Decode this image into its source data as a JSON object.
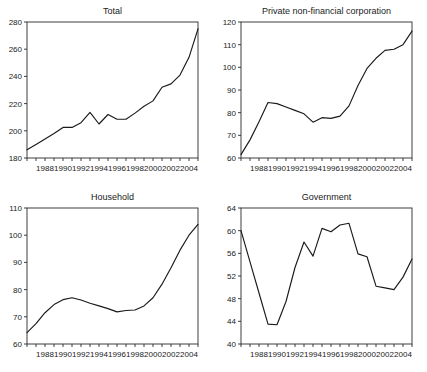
{
  "figure": {
    "width": 427,
    "height": 372,
    "background": "#ffffff",
    "line_color": "#1a1a1a",
    "axis_color": "#2a2a2a"
  },
  "panels": [
    {
      "id": "total",
      "title": "Total"
    },
    {
      "id": "corporation",
      "title": "Private non-financial corporation"
    },
    {
      "id": "household",
      "title": "Household"
    },
    {
      "id": "government",
      "title": "Government"
    }
  ],
  "chart_data": [
    {
      "type": "line",
      "title": "Total",
      "xlabel": "",
      "ylabel": "",
      "xlim": [
        1986,
        2005
      ],
      "ylim": [
        180,
        280
      ],
      "yticks": [
        180,
        200,
        220,
        240,
        260,
        280
      ],
      "ytick_labels": [
        "180",
        "200",
        "220",
        "240",
        "260",
        "280"
      ],
      "xticks": [
        1986,
        1987,
        1988,
        1989,
        1990,
        1991,
        1992,
        1993,
        1994,
        1995,
        1996,
        1997,
        1998,
        1999,
        2000,
        2001,
        2002,
        2003,
        2004,
        2005
      ],
      "xtick_labels": [
        "1988",
        "1990",
        "1992",
        "1994",
        "1996",
        "1998",
        "2000",
        "2002",
        "2004"
      ],
      "xtick_label_years": [
        1988,
        1990,
        1992,
        1994,
        1996,
        1998,
        2000,
        2002,
        2004
      ],
      "grid": false,
      "legend": false,
      "x": [
        1986,
        1987,
        1988,
        1989,
        1990,
        1991,
        1992,
        1993,
        1994,
        1995,
        1996,
        1997,
        1998,
        1999,
        2000,
        2001,
        2002,
        2003,
        2004,
        2005
      ],
      "values": [
        186,
        190,
        194,
        198,
        202.5,
        202.5,
        206,
        213.5,
        205,
        212,
        208.5,
        208.5,
        213,
        218,
        222,
        232,
        234.5,
        241,
        254,
        275
      ]
    },
    {
      "type": "line",
      "title": "Private non-financial corporation",
      "xlabel": "",
      "ylabel": "",
      "xlim": [
        1986,
        2005
      ],
      "ylim": [
        60,
        120
      ],
      "yticks": [
        60,
        70,
        80,
        90,
        100,
        110,
        120
      ],
      "ytick_labels": [
        "60",
        "70",
        "80",
        "90",
        "100",
        "110",
        "120"
      ],
      "xticks": [
        1986,
        1987,
        1988,
        1989,
        1990,
        1991,
        1992,
        1993,
        1994,
        1995,
        1996,
        1997,
        1998,
        1999,
        2000,
        2001,
        2002,
        2003,
        2004,
        2005
      ],
      "xtick_labels": [
        "1988",
        "1990",
        "1992",
        "1994",
        "1996",
        "1998",
        "2000",
        "2002",
        "2004"
      ],
      "xtick_label_years": [
        1988,
        1990,
        1992,
        1994,
        1996,
        1998,
        2000,
        2002,
        2004
      ],
      "grid": false,
      "legend": false,
      "x": [
        1986,
        1987,
        1988,
        1989,
        1990,
        1991,
        1992,
        1993,
        1994,
        1995,
        1996,
        1997,
        1998,
        1999,
        2000,
        2001,
        2002,
        2003,
        2004,
        2005
      ],
      "values": [
        61.5,
        68,
        76,
        84.5,
        84,
        82.5,
        81,
        79.5,
        75.8,
        77.8,
        77.5,
        78.5,
        83,
        92,
        99.5,
        104,
        107.5,
        108,
        110,
        116
      ]
    },
    {
      "type": "line",
      "title": "Household",
      "xlabel": "",
      "ylabel": "",
      "xlim": [
        1986,
        2005
      ],
      "ylim": [
        60,
        110
      ],
      "yticks": [
        60,
        70,
        80,
        90,
        100,
        110
      ],
      "ytick_labels": [
        "60",
        "70",
        "80",
        "90",
        "100",
        "110"
      ],
      "xticks": [
        1986,
        1987,
        1988,
        1989,
        1990,
        1991,
        1992,
        1993,
        1994,
        1995,
        1996,
        1997,
        1998,
        1999,
        2000,
        2001,
        2002,
        2003,
        2004,
        2005
      ],
      "xtick_labels": [
        "1988",
        "1990",
        "1992",
        "1994",
        "1996",
        "1998",
        "2000",
        "2002",
        "2004"
      ],
      "xtick_label_years": [
        1988,
        1990,
        1992,
        1994,
        1996,
        1998,
        2000,
        2002,
        2004
      ],
      "grid": false,
      "legend": false,
      "x": [
        1986,
        1987,
        1988,
        1989,
        1990,
        1991,
        1992,
        1993,
        1994,
        1995,
        1996,
        1997,
        1998,
        1999,
        2000,
        2001,
        2002,
        2003,
        2004,
        2005
      ],
      "values": [
        64.2,
        67.5,
        71.5,
        74.5,
        76.3,
        77,
        76.2,
        75,
        74,
        73,
        71.8,
        72.3,
        72.5,
        74,
        77,
        82,
        88,
        94.5,
        100,
        104
      ]
    },
    {
      "type": "line",
      "title": "Government",
      "xlabel": "",
      "ylabel": "",
      "xlim": [
        1986,
        2005
      ],
      "ylim": [
        40,
        64
      ],
      "yticks": [
        40,
        44,
        48,
        52,
        56,
        60,
        64
      ],
      "ytick_labels": [
        "40",
        "44",
        "48",
        "52",
        "56",
        "60",
        "64"
      ],
      "xticks": [
        1986,
        1987,
        1988,
        1989,
        1990,
        1991,
        1992,
        1993,
        1994,
        1995,
        1996,
        1997,
        1998,
        1999,
        2000,
        2001,
        2002,
        2003,
        2004,
        2005
      ],
      "xtick_labels": [
        "1988",
        "1990",
        "1992",
        "1994",
        "1996",
        "1998",
        "2000",
        "2002",
        "2004"
      ],
      "xtick_label_years": [
        1988,
        1990,
        1992,
        1994,
        1996,
        1998,
        2000,
        2002,
        2004
      ],
      "grid": false,
      "legend": false,
      "x": [
        1986,
        1987,
        1988,
        1989,
        1990,
        1991,
        1992,
        1993,
        1994,
        1995,
        1996,
        1997,
        1998,
        1999,
        2000,
        2001,
        2002,
        2003,
        2004,
        2005
      ],
      "values": [
        60,
        54.5,
        49,
        43.5,
        43.4,
        47.5,
        53.5,
        58,
        55.5,
        60.4,
        59.8,
        61,
        61.3,
        55.9,
        55.4,
        50.2,
        49.9,
        49.6,
        51.8,
        55
      ]
    }
  ]
}
